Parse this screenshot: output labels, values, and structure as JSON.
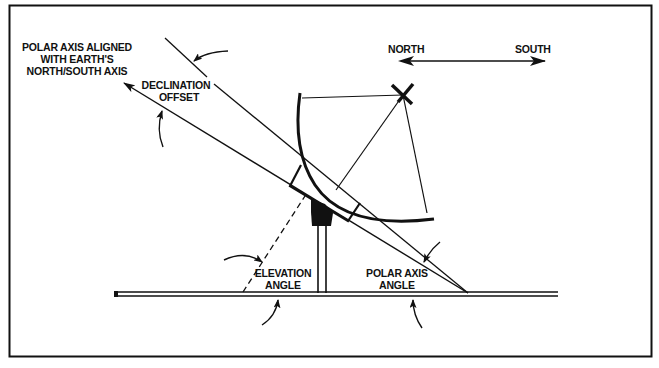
{
  "diagram": {
    "labels": {
      "polar_axis_aligned": [
        "POLAR AXIS ALIGNED",
        "WITH EARTH'S",
        "NORTH/SOUTH AXIS"
      ],
      "declination_offset": [
        "DECLINATION",
        "OFFSET"
      ],
      "north": "NORTH",
      "south": "SOUTH",
      "elevation_angle": [
        "ELEVATION",
        "ANGLE"
      ],
      "polar_axis_angle": [
        "POLAR AXIS",
        "ANGLE"
      ]
    },
    "colors": {
      "ink": "#111111",
      "background": "#ffffff"
    }
  }
}
